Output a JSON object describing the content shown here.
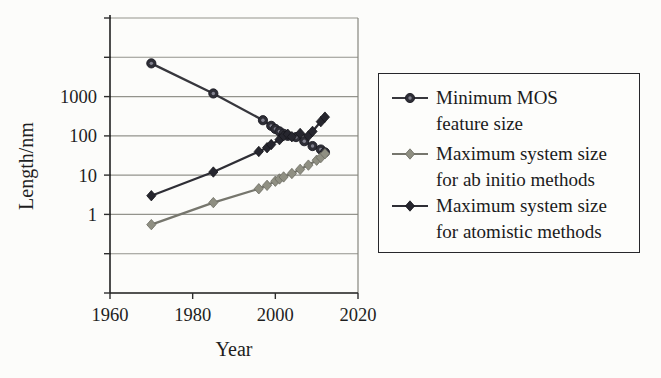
{
  "figure": {
    "background": "#fcfcfa",
    "text_color": "#1e1e1e"
  },
  "chart_data": {
    "type": "line",
    "title": "",
    "xlabel": "Year",
    "ylabel": "Length/nm",
    "grid": true,
    "legend_position": "right",
    "x_axis": {
      "min": 1960,
      "max": 2020,
      "ticks": [
        1960,
        1980,
        2000,
        2020
      ]
    },
    "y_axis": {
      "scale": "log",
      "min": 0.01,
      "max": 100000,
      "gridline_decades": [
        100000,
        10000,
        1000,
        100,
        10,
        1,
        0.1,
        0.01
      ],
      "labeled_ticks": [
        {
          "value": 1000,
          "label": "1000"
        },
        {
          "value": 100,
          "label": "100"
        },
        {
          "value": 10,
          "label": "10"
        },
        {
          "value": 1,
          "label": "1"
        }
      ]
    },
    "colors": {
      "grid": "#93938c",
      "frame": "#85857e",
      "axis": "#2d2d2d"
    },
    "series": [
      {
        "name": "Minimum MOS feature size",
        "marker": "donut-circle",
        "color": "#2e2e36",
        "inner": "#82828f",
        "stroke": "#1b1b22",
        "line_color": "#37373d",
        "points": [
          [
            1970,
            7000
          ],
          [
            1985,
            1200
          ],
          [
            1997,
            250
          ],
          [
            1999,
            180
          ],
          [
            2000,
            150
          ],
          [
            2001,
            130
          ],
          [
            2002,
            113
          ],
          [
            2003,
            100
          ],
          [
            2005,
            93
          ],
          [
            2007,
            73
          ],
          [
            2009,
            55
          ],
          [
            2011,
            45
          ],
          [
            2012,
            38
          ]
        ]
      },
      {
        "name": "Maximum system size for ab initio methods",
        "marker": "diamond",
        "color": "#8f8f82",
        "stroke": "#6b6b61",
        "line_color": "#76766d",
        "points": [
          [
            1970,
            0.55
          ],
          [
            1985,
            2
          ],
          [
            1996,
            4.5
          ],
          [
            1998,
            5.5
          ],
          [
            2000,
            7
          ],
          [
            2001,
            8
          ],
          [
            2002,
            9
          ],
          [
            2004,
            11
          ],
          [
            2006,
            14
          ],
          [
            2008,
            18
          ],
          [
            2010,
            24
          ],
          [
            2011,
            28
          ],
          [
            2012,
            35
          ]
        ]
      },
      {
        "name": "Maximum system size for atomistic methods",
        "marker": "diamond",
        "color": "#26262e",
        "stroke": "#15151b",
        "line_color": "#2e2e35",
        "points": [
          [
            1970,
            3
          ],
          [
            1985,
            12
          ],
          [
            1996,
            40
          ],
          [
            1998,
            50
          ],
          [
            1999,
            60
          ],
          [
            2001,
            80
          ],
          [
            2002,
            100
          ],
          [
            2003,
            110
          ],
          [
            2004,
            95
          ],
          [
            2006,
            115
          ],
          [
            2008,
            100
          ],
          [
            2009,
            130
          ],
          [
            2011,
            230
          ],
          [
            2012,
            300
          ]
        ]
      }
    ]
  },
  "legend": {
    "items": [
      {
        "line1": "Minimum MOS",
        "line2": "feature size",
        "marker_icon": "circle-marker-icon"
      },
      {
        "line1": "Maximum system size",
        "line2": "for ab initio methods",
        "marker_icon": "diamond-marker-icon"
      },
      {
        "line1": "Maximum system size",
        "line2": "for atomistic methods",
        "marker_icon": "diamond-marker-icon"
      }
    ]
  }
}
